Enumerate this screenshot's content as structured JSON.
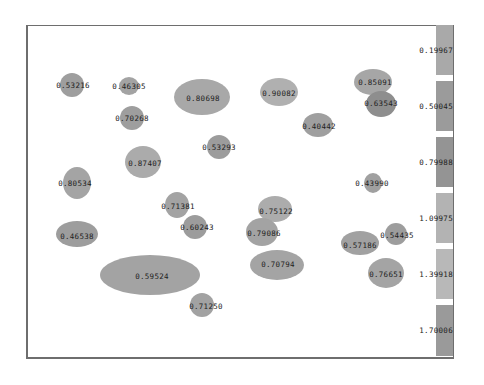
{
  "chart_data": {
    "type": "scatter",
    "title": "",
    "xlabel": "",
    "ylabel": "",
    "grid": false,
    "legend_position": "right",
    "legend": {
      "type": "color-scale",
      "entries": [
        {
          "label": "0.19967",
          "color": "#a9a9a9",
          "top": 25,
          "height": 50
        },
        {
          "label": "0.50045",
          "color": "#9b9b9b",
          "top": 81,
          "height": 50
        },
        {
          "label": "0.79988",
          "color": "#949494",
          "top": 137,
          "height": 50
        },
        {
          "label": "1.09975",
          "color": "#b3b3b3",
          "top": 193,
          "height": 50
        },
        {
          "label": "1.39918",
          "color": "#b8b8b8",
          "top": 249,
          "height": 50
        },
        {
          "label": "1.70006",
          "color": "#9a9a9a",
          "top": 305,
          "height": 51
        }
      ]
    },
    "points": [
      {
        "label": "0.53216",
        "cx": 72,
        "cy": 85,
        "rx": 12,
        "ry": 12,
        "color": "#9e9e9e",
        "lx": 73,
        "ly": 85
      },
      {
        "label": "0.46305",
        "cx": 129,
        "cy": 86,
        "rx": 10,
        "ry": 9,
        "color": "#a3a3a3",
        "lx": 129,
        "ly": 86
      },
      {
        "label": "0.80698",
        "cx": 202,
        "cy": 97,
        "rx": 28,
        "ry": 18,
        "color": "#a8a8a8",
        "lx": 203,
        "ly": 98
      },
      {
        "label": "0.90082",
        "cx": 279,
        "cy": 92,
        "rx": 19,
        "ry": 14,
        "color": "#b0b0b0",
        "lx": 279,
        "ly": 93
      },
      {
        "label": "0.85091",
        "cx": 373,
        "cy": 82,
        "rx": 19,
        "ry": 13,
        "color": "#a6a6a6",
        "lx": 375,
        "ly": 82
      },
      {
        "label": "0.63543",
        "cx": 381,
        "cy": 104,
        "rx": 15,
        "ry": 13,
        "color": "#8e8e8e",
        "lx": 381,
        "ly": 103
      },
      {
        "label": "0.70268",
        "cx": 132,
        "cy": 118,
        "rx": 12,
        "ry": 12,
        "color": "#9e9e9e",
        "lx": 132,
        "ly": 118
      },
      {
        "label": "0.40442",
        "cx": 318,
        "cy": 125,
        "rx": 15,
        "ry": 12,
        "color": "#9f9f9f",
        "lx": 319,
        "ly": 126
      },
      {
        "label": "0.53293",
        "cx": 219,
        "cy": 147,
        "rx": 12,
        "ry": 12,
        "color": "#9c9c9c",
        "lx": 219,
        "ly": 147
      },
      {
        "label": "0.87407",
        "cx": 143,
        "cy": 162,
        "rx": 18,
        "ry": 16,
        "color": "#ababab",
        "lx": 145,
        "ly": 163
      },
      {
        "label": "0.80534",
        "cx": 77,
        "cy": 183,
        "rx": 14,
        "ry": 16,
        "color": "#a4a4a4",
        "lx": 75,
        "ly": 183
      },
      {
        "label": "0.43990",
        "cx": 373,
        "cy": 183,
        "rx": 9,
        "ry": 10,
        "color": "#a0a0a0",
        "lx": 372,
        "ly": 183
      },
      {
        "label": "0.71381",
        "cx": 177,
        "cy": 205,
        "rx": 12,
        "ry": 13,
        "color": "#a3a3a3",
        "lx": 178,
        "ly": 206
      },
      {
        "label": "0.75122",
        "cx": 275,
        "cy": 209,
        "rx": 17,
        "ry": 13,
        "color": "#acacac",
        "lx": 276,
        "ly": 211
      },
      {
        "label": "0.60243",
        "cx": 195,
        "cy": 227,
        "rx": 12,
        "ry": 12,
        "color": "#9c9c9c",
        "lx": 197,
        "ly": 227
      },
      {
        "label": "0.79086",
        "cx": 262,
        "cy": 232,
        "rx": 16,
        "ry": 14,
        "color": "#a3a3a3",
        "lx": 264,
        "ly": 233
      },
      {
        "label": "0.46538",
        "cx": 77,
        "cy": 234,
        "rx": 21,
        "ry": 13,
        "color": "#9d9d9d",
        "lx": 77,
        "ly": 236
      },
      {
        "label": "0.54435",
        "cx": 396,
        "cy": 234,
        "rx": 11,
        "ry": 11,
        "color": "#9d9d9d",
        "lx": 397,
        "ly": 235
      },
      {
        "label": "0.57186",
        "cx": 360,
        "cy": 243,
        "rx": 19,
        "ry": 12,
        "color": "#a1a1a1",
        "lx": 360,
        "ly": 245
      },
      {
        "label": "0.70794",
        "cx": 277,
        "cy": 265,
        "rx": 27,
        "ry": 15,
        "color": "#a4a4a4",
        "lx": 278,
        "ly": 264
      },
      {
        "label": "0.59524",
        "cx": 150,
        "cy": 275,
        "rx": 50,
        "ry": 20,
        "color": "#a3a3a3",
        "lx": 152,
        "ly": 276
      },
      {
        "label": "0.76651",
        "cx": 386,
        "cy": 273,
        "rx": 18,
        "ry": 15,
        "color": "#a4a4a4",
        "lx": 386,
        "ly": 274
      },
      {
        "label": "0.71250",
        "cx": 202,
        "cy": 305,
        "rx": 12,
        "ry": 12,
        "color": "#a2a2a2",
        "lx": 206,
        "ly": 306
      }
    ]
  }
}
